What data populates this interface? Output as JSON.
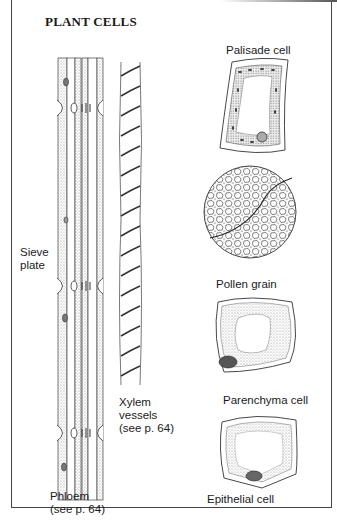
{
  "figure": {
    "title": "PLANT CELLS",
    "labels": {
      "palisade": "Palisade cell",
      "pollen": "Pollen grain",
      "parenchyma": "Parenchyma cell",
      "epithelial": "Epithelial cell",
      "sieve_line1": "Sieve",
      "sieve_line2": "plate",
      "xylem_line1": "Xylem",
      "xylem_line2": "vessels",
      "xylem_line3": "(see p. 64)",
      "phloem_line1": "Phloem",
      "phloem_line2": "(see p. 64)"
    },
    "colors": {
      "ink": "#1a1a1a",
      "stipple": "#9a9a9a",
      "frame": "#444444"
    }
  }
}
